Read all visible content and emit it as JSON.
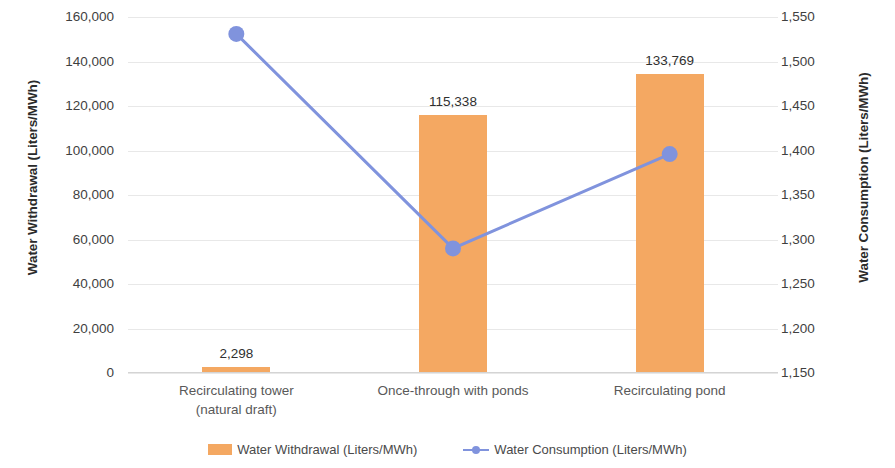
{
  "chart_data": {
    "type": "bar",
    "title": "",
    "categories": [
      "Recirculating tower\n(natural draft)",
      "Once-through with ponds",
      "Recirculating pond"
    ],
    "category_lines": [
      [
        "Recirculating tower",
        "(natural draft)"
      ],
      [
        "Once-through with ponds",
        ""
      ],
      [
        "Recirculating pond",
        ""
      ]
    ],
    "series": [
      {
        "name": "Water Withdrawal (Liters/MWh)",
        "type": "bar",
        "axis": "left",
        "color": "#F4A862",
        "values": [
          2298,
          115338,
          133769
        ],
        "labels": [
          "2,298",
          "115,338",
          "133,769"
        ]
      },
      {
        "name": "Water Consumption (Liters/MWh)",
        "type": "line",
        "axis": "right",
        "color": "#8093DD",
        "values": [
          1531,
          1290,
          1396
        ],
        "labels": [
          "",
          "",
          ""
        ]
      }
    ],
    "xlabel": "",
    "ylabel": "Water Withdrawal (Liters/MWh)",
    "y2label": "Water Consumption (Liters/MWh)",
    "ylim": [
      0,
      160000
    ],
    "y2lim": [
      1150,
      1550
    ],
    "yticks": [
      0,
      20000,
      40000,
      60000,
      80000,
      100000,
      120000,
      140000,
      160000
    ],
    "ytick_labels": [
      "0",
      "20,000",
      "40,000",
      "60,000",
      "80,000",
      "100,000",
      "120,000",
      "140,000",
      "160,000"
    ],
    "y2ticks": [
      1150,
      1200,
      1250,
      1300,
      1350,
      1400,
      1450,
      1500,
      1550
    ],
    "y2tick_labels": [
      "1,150",
      "1,200",
      "1,250",
      "1,300",
      "1,350",
      "1,400",
      "1,450",
      "1,500",
      "1,550"
    ],
    "grid": true,
    "legend_position": "bottom",
    "legend": [
      "Water Withdrawal (Liters/MWh)",
      "Water Consumption (Liters/MWh)"
    ]
  }
}
